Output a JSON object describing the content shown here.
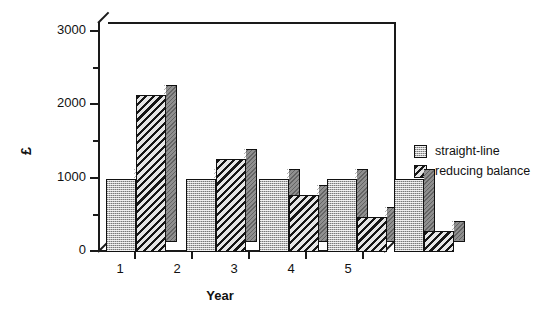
{
  "chart_data": {
    "type": "bar",
    "title": "",
    "subtitle": "",
    "xlabel": "Year",
    "ylabel": "£",
    "categories": [
      "1",
      "2",
      "3",
      "4",
      "5"
    ],
    "series": [
      {
        "name": "straight-line",
        "values": [
          1000,
          1000,
          1000,
          1000,
          1000
        ],
        "fill": "stipple"
      },
      {
        "name": "reducing balance",
        "values": [
          2150,
          1280,
          780,
          480,
          290
        ],
        "fill": "hatch"
      }
    ],
    "ylim": [
      0,
      3000
    ],
    "y_major_ticks": [
      "0",
      "1000",
      "2000",
      "3000"
    ],
    "y_minor_ticks": [
      500,
      1500,
      2500
    ],
    "grid": false,
    "legend_position": "right",
    "style": "3d-bar-grayscale"
  },
  "axes": {
    "y_title": "£",
    "x_title": "Year",
    "y_labels": [
      "3000",
      "2000",
      "1000",
      "0"
    ],
    "x_labels": [
      "1",
      "2",
      "3",
      "4",
      "5"
    ]
  },
  "legend": {
    "items": [
      {
        "label": "straight-line",
        "swatch": "stipple-swatch"
      },
      {
        "label": "reducing balance",
        "swatch": "hatch-swatch"
      }
    ]
  },
  "colors": {
    "bar_front_straight": "#b9b9b9",
    "bar_front_reducing": "#c8c8c8",
    "bar_side": "#8f8f8f",
    "bar_top": "#ffffff",
    "axis": "#1a1a1a",
    "background": "#ffffff"
  }
}
